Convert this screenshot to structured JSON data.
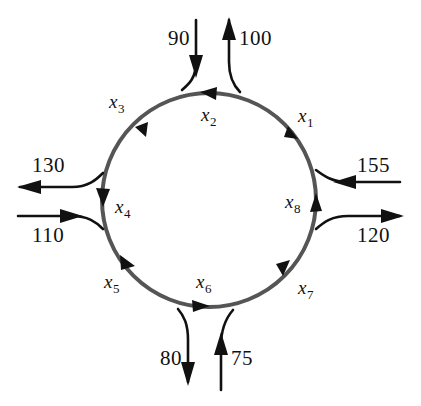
{
  "diagram": {
    "type": "traffic-flow-network",
    "title": "",
    "circle": {
      "center_x": 209,
      "center_y": 200,
      "radius": 107,
      "stroke_color": "#555555",
      "flow_direction": "counterclockwise"
    },
    "external_flows": [
      {
        "id": "flow-in-top-left",
        "value": "90",
        "direction": "in",
        "side": "top",
        "label_x": 168,
        "label_y": 28
      },
      {
        "id": "flow-out-top-right",
        "value": "100",
        "direction": "out",
        "side": "top",
        "label_x": 239,
        "label_y": 28
      },
      {
        "id": "flow-in-right-top",
        "value": "155",
        "direction": "in",
        "side": "right",
        "label_x": 357,
        "label_y": 155
      },
      {
        "id": "flow-out-right-bottom",
        "value": "120",
        "direction": "out",
        "side": "right",
        "label_x": 357,
        "label_y": 225
      },
      {
        "id": "flow-out-bottom-left",
        "value": "80",
        "direction": "out",
        "side": "bottom",
        "label_x": 160,
        "label_y": 348
      },
      {
        "id": "flow-in-bottom-right",
        "value": "75",
        "direction": "in",
        "side": "bottom",
        "label_x": 231,
        "label_y": 348
      },
      {
        "id": "flow-out-left-top",
        "value": "130",
        "direction": "out",
        "side": "left",
        "label_x": 32,
        "label_y": 155
      },
      {
        "id": "flow-in-left-bottom",
        "value": "110",
        "direction": "in",
        "side": "left",
        "label_x": 32,
        "label_y": 225
      }
    ],
    "arc_variables": [
      {
        "id": "x1",
        "base": "x",
        "subscript": "1",
        "label_x": 298,
        "label_y": 106,
        "arc_position": "upper-right"
      },
      {
        "id": "x2",
        "base": "x",
        "subscript": "2",
        "label_x": 201,
        "label_y": 105,
        "arc_position": "top"
      },
      {
        "id": "x3",
        "base": "x",
        "subscript": "3",
        "label_x": 109,
        "label_y": 92,
        "arc_position": "upper-left"
      },
      {
        "id": "x4",
        "base": "x",
        "subscript": "4",
        "label_x": 115,
        "label_y": 197,
        "arc_position": "left"
      },
      {
        "id": "x5",
        "base": "x",
        "subscript": "5",
        "label_x": 104,
        "label_y": 272,
        "arc_position": "lower-left"
      },
      {
        "id": "x6",
        "base": "x",
        "subscript": "6",
        "label_x": 196,
        "label_y": 272,
        "arc_position": "bottom"
      },
      {
        "id": "x7",
        "base": "x",
        "subscript": "7",
        "label_x": 298,
        "label_y": 278,
        "arc_position": "lower-right"
      },
      {
        "id": "x8",
        "base": "x",
        "subscript": "8",
        "label_x": 285,
        "label_y": 192,
        "arc_position": "right"
      }
    ]
  }
}
